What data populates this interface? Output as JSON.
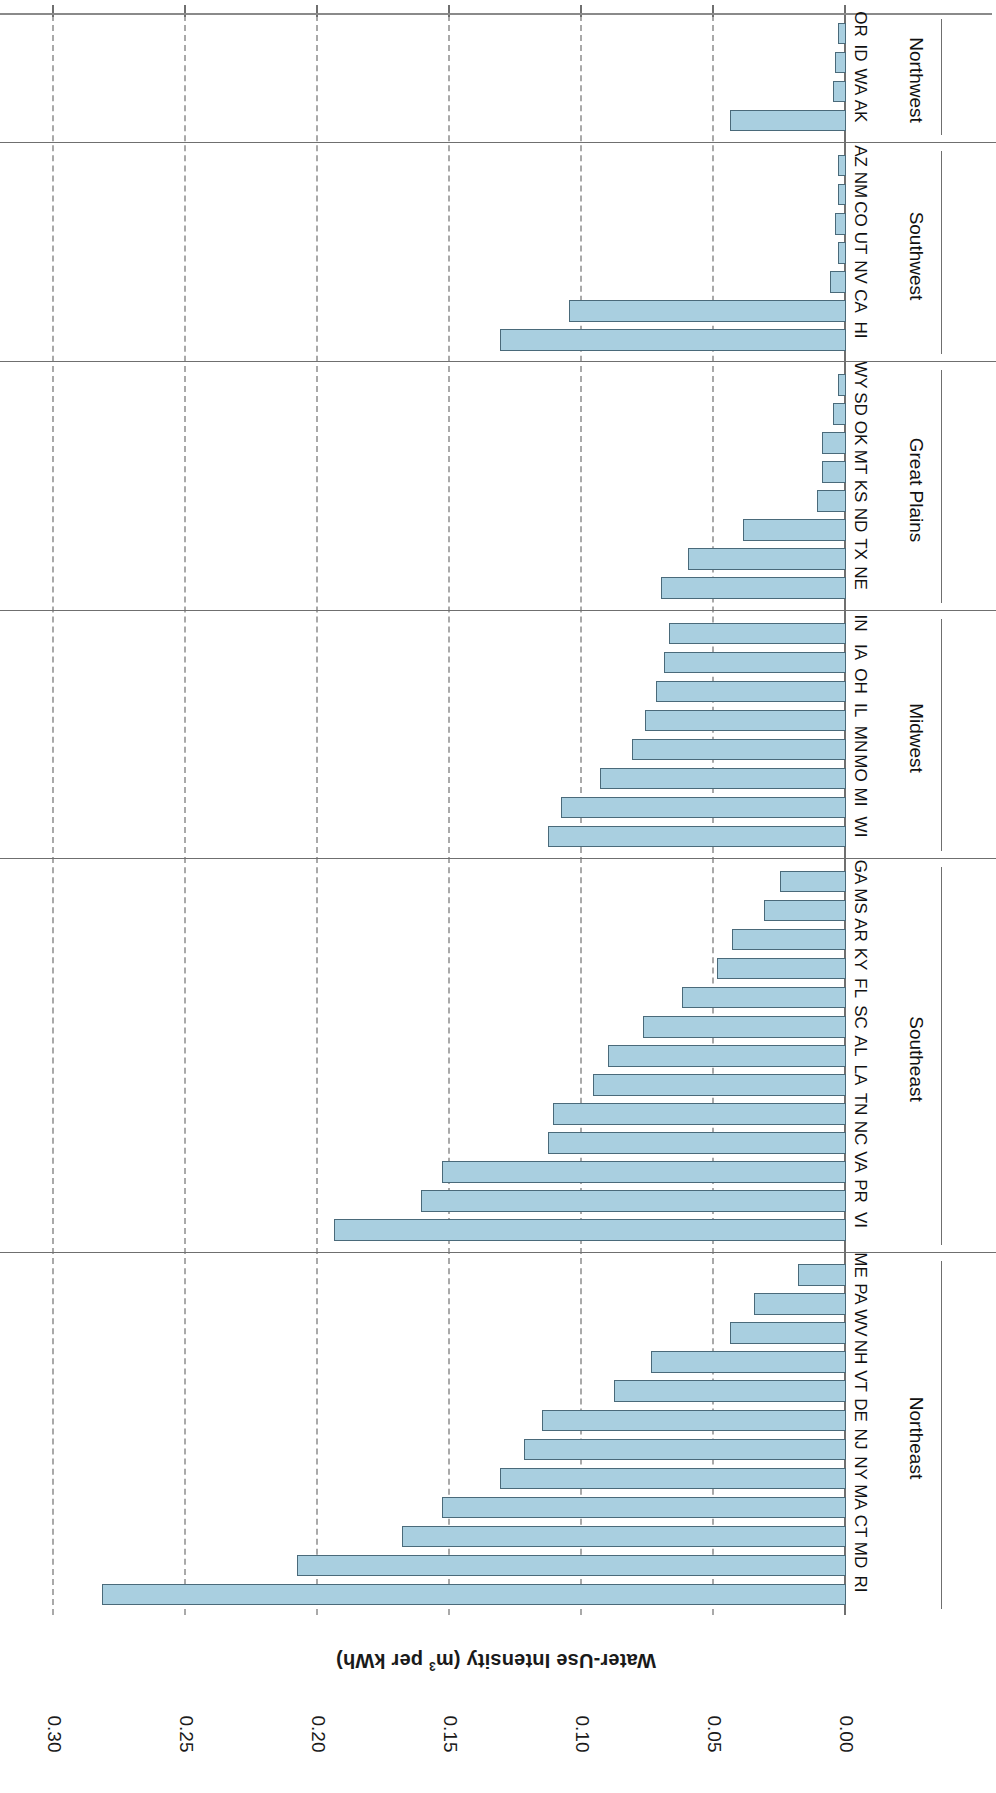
{
  "chart_data": {
    "type": "bar",
    "orientation": "horizontal",
    "title": "",
    "xlabel": "Water-Use Intensity (m3 per kWh)",
    "ylabel": "",
    "xlim": [
      0.0,
      0.3
    ],
    "xticks": [
      "0.00",
      "0.05",
      "0.10",
      "0.15",
      "0.20",
      "0.25",
      "0.30"
    ],
    "xtick_values": [
      0.0,
      0.05,
      0.1,
      0.15,
      0.2,
      0.25,
      0.3
    ],
    "grid": "vertical-dashed",
    "legend": "none",
    "bar_color": "#a9cfe0",
    "bar_edge_color": "#4a6a7a",
    "units": "m3 per kWh",
    "categories": [
      "RI",
      "MD",
      "CT",
      "MA",
      "NY",
      "NJ",
      "DE",
      "VT",
      "NH",
      "WV",
      "PA",
      "ME",
      "VI",
      "PR",
      "VA",
      "NC",
      "TN",
      "LA",
      "AL",
      "SC",
      "FL",
      "KY",
      "AR",
      "MS",
      "GA",
      "WI",
      "MI",
      "MO",
      "MN",
      "IL",
      "OH",
      "IA",
      "IN",
      "NE",
      "TX",
      "ND",
      "KS",
      "MT",
      "OK",
      "SD",
      "WY",
      "HI",
      "CA",
      "NV",
      "UT",
      "CO",
      "NM",
      "AZ",
      "AK",
      "WA",
      "ID",
      "OR"
    ],
    "values": [
      0.282,
      0.208,
      0.168,
      0.153,
      0.131,
      0.122,
      0.115,
      0.088,
      0.074,
      0.044,
      0.035,
      0.018,
      0.194,
      0.161,
      0.153,
      0.113,
      0.111,
      0.096,
      0.09,
      0.077,
      0.062,
      0.049,
      0.043,
      0.031,
      0.025,
      0.113,
      0.108,
      0.093,
      0.081,
      0.076,
      0.072,
      0.069,
      0.067,
      0.07,
      0.06,
      0.039,
      0.011,
      0.009,
      0.009,
      0.005,
      0.003,
      0.131,
      0.105,
      0.006,
      0.003,
      0.004,
      0.003,
      0.003,
      0.044,
      0.005,
      0.004,
      0.003
    ],
    "groups": [
      {
        "name": "Northeast",
        "states": [
          "RI",
          "MD",
          "CT",
          "MA",
          "NY",
          "NJ",
          "DE",
          "VT",
          "NH",
          "WV",
          "PA",
          "ME"
        ]
      },
      {
        "name": "Southeast",
        "states": [
          "VI",
          "PR",
          "VA",
          "NC",
          "TN",
          "LA",
          "AL",
          "SC",
          "FL",
          "KY",
          "AR",
          "MS",
          "GA"
        ]
      },
      {
        "name": "Midwest",
        "states": [
          "WI",
          "MI",
          "MO",
          "MN",
          "IL",
          "OH",
          "IA",
          "IN"
        ]
      },
      {
        "name": "Great Plains",
        "states": [
          "NE",
          "TX",
          "ND",
          "KS",
          "MT",
          "OK",
          "SD",
          "WY"
        ]
      },
      {
        "name": "Southwest",
        "states": [
          "HI",
          "CA",
          "NV",
          "UT",
          "CO",
          "NM",
          "AZ"
        ]
      },
      {
        "name": "Northwest",
        "states": [
          "AK",
          "WA",
          "ID",
          "OR"
        ]
      }
    ]
  }
}
